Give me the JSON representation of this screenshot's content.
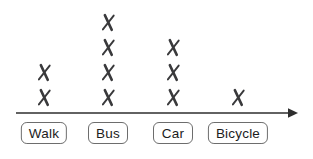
{
  "chart_data": {
    "type": "scatter",
    "subtype": "dot-plot (line plot with X tally marks)",
    "title": "",
    "xlabel": "",
    "ylabel": "",
    "categories": [
      "Walk",
      "Bus",
      "Car",
      "Bicycle"
    ],
    "values": [
      2,
      4,
      3,
      1
    ],
    "marker": "✗",
    "marker_color": "#3a3a3c",
    "axis": {
      "orientation": "horizontal",
      "arrow_direction": "right",
      "color": "#2e2e2e",
      "ticks": [],
      "grid": "off"
    },
    "legend": "none",
    "category_label_style": {
      "box_fill": "#ffffff",
      "box_border_color": "#6d6d6d",
      "text_color": "#1c1c1c"
    }
  }
}
